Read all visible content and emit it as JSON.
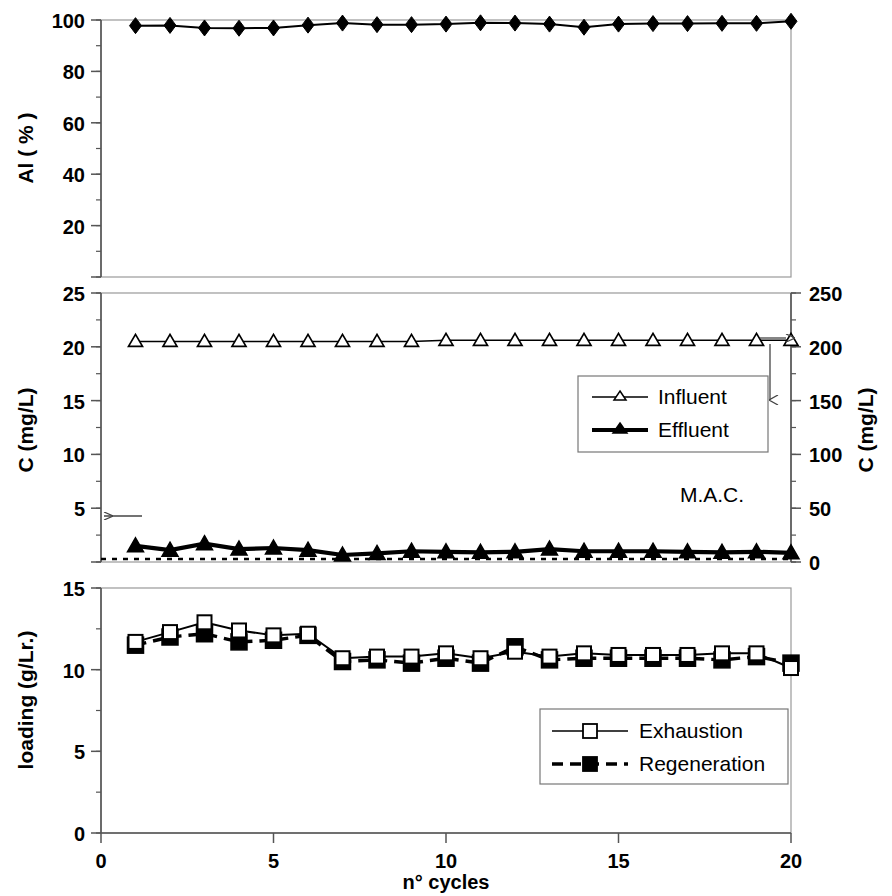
{
  "figure": {
    "xaxis": {
      "title": "n° cycles",
      "min": 0,
      "max": 20,
      "ticks": [
        0,
        5,
        10,
        15,
        20
      ],
      "tick_labels": [
        "0",
        "5",
        "10",
        "15",
        "20"
      ]
    }
  },
  "chart_data": [
    {
      "type": "line",
      "panel": "top",
      "title": "",
      "xlabel": "n° cycles",
      "ylabel": "Al ( % )",
      "xlim": [
        0,
        20
      ],
      "ylim": [
        0,
        100
      ],
      "yticks": [
        0,
        20,
        40,
        60,
        80,
        100
      ],
      "ytick_labels": [
        "",
        "20",
        "40",
        "60",
        "80",
        "100"
      ],
      "grid": false,
      "legend": "none",
      "x": [
        1,
        2,
        3,
        4,
        5,
        6,
        7,
        8,
        9,
        10,
        11,
        12,
        13,
        14,
        15,
        16,
        17,
        18,
        19,
        20
      ],
      "series": [
        {
          "name": "Al",
          "marker": "filled-diamond",
          "line": "solid",
          "values": [
            97.8,
            97.9,
            96.9,
            96.8,
            96.9,
            98.0,
            98.8,
            98.2,
            98.2,
            98.4,
            98.9,
            98.8,
            98.4,
            97.2,
            98.4,
            98.6,
            98.6,
            98.7,
            98.7,
            99.5
          ]
        }
      ]
    },
    {
      "type": "line",
      "panel": "middle",
      "title": "",
      "xlabel": "n° cycles",
      "ylabel": "C (mg/L)",
      "ylabel_right": "C (mg/L)",
      "xlim": [
        0,
        20
      ],
      "ylim": [
        0,
        25
      ],
      "ylim_right": [
        0,
        250
      ],
      "yticks": [
        0,
        5,
        10,
        15,
        20,
        25
      ],
      "ytick_labels": [
        "",
        "5",
        "10",
        "15",
        "20",
        "25"
      ],
      "yticks_right": [
        0,
        50,
        100,
        150,
        200,
        250
      ],
      "ytick_labels_right": [
        "0",
        "50",
        "100",
        "150",
        "200",
        "250"
      ],
      "grid": false,
      "legend": "inside-right",
      "x": [
        1,
        2,
        3,
        4,
        5,
        6,
        7,
        8,
        9,
        10,
        11,
        12,
        13,
        14,
        15,
        16,
        17,
        18,
        19,
        20
      ],
      "series": [
        {
          "name": "Influent",
          "marker": "open-triangle",
          "line": "thin-solid",
          "axis": "right",
          "values": [
            205,
            205,
            205,
            205,
            205,
            205,
            205,
            205,
            205,
            206,
            206,
            206,
            206,
            206,
            206,
            206,
            206,
            206,
            206,
            206
          ]
        },
        {
          "name": "Effluent",
          "marker": "filled-triangle",
          "line": "thick-solid",
          "axis": "left",
          "values": [
            1.5,
            1.1,
            1.7,
            1.2,
            1.3,
            1.1,
            0.65,
            0.8,
            1.0,
            0.95,
            0.9,
            0.95,
            1.2,
            1.0,
            1.0,
            1.0,
            0.95,
            0.9,
            0.95,
            0.85
          ]
        }
      ],
      "annotations": [
        {
          "name": "mac-line",
          "label": "M.A.C.",
          "value": 0.28,
          "axis": "left",
          "style": "dotted"
        },
        {
          "name": "left-arrow",
          "label": "",
          "points_to": "left-axis"
        },
        {
          "name": "right-arrow",
          "label": "",
          "points_to": "right-axis"
        },
        {
          "name": "down-arrow",
          "label": "",
          "points_to": "right-axis"
        }
      ]
    },
    {
      "type": "line",
      "panel": "bottom",
      "title": "",
      "xlabel": "n° cycles",
      "ylabel": "loading (g/Lr.)",
      "xlim": [
        0,
        20
      ],
      "ylim": [
        0,
        15
      ],
      "yticks": [
        0,
        5,
        10,
        15
      ],
      "ytick_labels": [
        "0",
        "5",
        "10",
        "15"
      ],
      "grid": false,
      "legend": "inside-right",
      "x": [
        1,
        2,
        3,
        4,
        5,
        6,
        7,
        8,
        9,
        10,
        11,
        12,
        13,
        14,
        15,
        16,
        17,
        18,
        19,
        20
      ],
      "series": [
        {
          "name": "Exhaustion",
          "marker": "open-square",
          "line": "solid",
          "values": [
            11.7,
            12.3,
            12.9,
            12.4,
            12.1,
            12.2,
            10.7,
            10.8,
            10.8,
            11.0,
            10.7,
            11.1,
            10.8,
            11.0,
            10.9,
            10.9,
            10.9,
            11.0,
            11.0,
            10.1
          ]
        },
        {
          "name": "Regeneration",
          "marker": "filled-square",
          "line": "dashed",
          "values": [
            11.5,
            12.0,
            12.2,
            11.7,
            11.8,
            12.1,
            10.5,
            10.6,
            10.4,
            10.7,
            10.4,
            11.4,
            10.6,
            10.7,
            10.7,
            10.7,
            10.7,
            10.6,
            10.8,
            10.4
          ]
        }
      ]
    }
  ],
  "legends": {
    "middle": [
      {
        "label": "Influent",
        "marker": "open-triangle",
        "line": "thin-solid"
      },
      {
        "label": "Effluent",
        "marker": "filled-triangle",
        "line": "thick-solid"
      }
    ],
    "bottom": [
      {
        "label": "Exhaustion",
        "marker": "open-square",
        "line": "solid"
      },
      {
        "label": "Regeneration",
        "marker": "filled-square",
        "line": "dashed"
      }
    ]
  },
  "colors": {
    "ink": "#000000",
    "axis": "#555555",
    "background": "#ffffff"
  }
}
